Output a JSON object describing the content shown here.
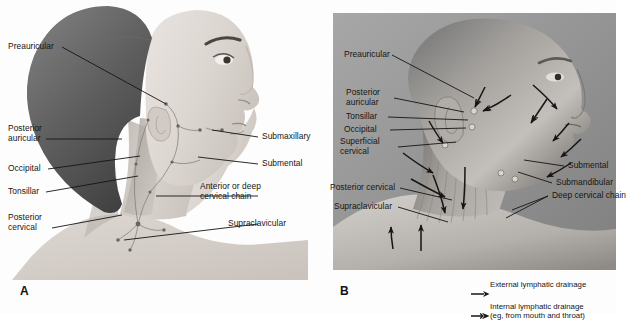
{
  "figure": {
    "panels": [
      {
        "id": "A",
        "letter": "A",
        "type": "illustration",
        "labels": [
          {
            "name": "preauricular",
            "text": "Preauricular"
          },
          {
            "name": "posterior-auricular",
            "text": "Posterior\nauricular"
          },
          {
            "name": "occipital",
            "text": "Occipital"
          },
          {
            "name": "tonsillar",
            "text": "Tonsillar"
          },
          {
            "name": "posterior-cervical",
            "text": "Posterior\ncervical"
          },
          {
            "name": "submaxillary",
            "text": "Submaxillary"
          },
          {
            "name": "submental",
            "text": "Submental"
          },
          {
            "name": "anterior-deep-cervical",
            "text": "Anterior or deep\ncervical chain"
          },
          {
            "name": "supraclavicular",
            "text": "Supraclavicular"
          }
        ]
      },
      {
        "id": "B",
        "letter": "B",
        "type": "photograph",
        "labels": [
          {
            "name": "preauricular",
            "text": "Preauricular"
          },
          {
            "name": "posterior-auricular",
            "text": "Posterior\nauricular"
          },
          {
            "name": "tonsillar",
            "text": "Tonsillar"
          },
          {
            "name": "occipital",
            "text": "Occipital"
          },
          {
            "name": "superficial-cervical",
            "text": "Superficial\ncervical"
          },
          {
            "name": "posterior-cervical",
            "text": "Posterior cervical"
          },
          {
            "name": "supraclavicular",
            "text": "Supraclavicular"
          },
          {
            "name": "submental",
            "text": "Submental"
          },
          {
            "name": "submandibular",
            "text": "Submandibular"
          },
          {
            "name": "deep-cervical-chain",
            "text": "Deep cervical chain"
          }
        ]
      }
    ],
    "legend": [
      {
        "name": "external-lymphatic-drainage",
        "icon": "solid-arrow-icon",
        "text": "External lymphatic drainage"
      },
      {
        "name": "internal-lymphatic-drainage",
        "icon": "feathered-arrow-icon",
        "text": "Internal lymphatic drainage\n(eg, from mouth and throat)"
      }
    ]
  }
}
